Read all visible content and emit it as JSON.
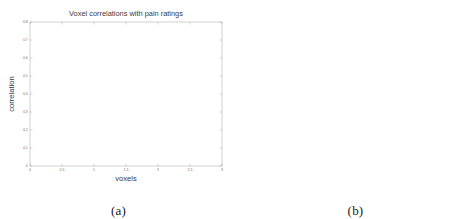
{
  "figure": {
    "panels": [
      {
        "caption": "(a)",
        "chart_data": {
          "type": "area",
          "title": "Voxel correlations with pain ratings",
          "xlabel": "voxels",
          "ylabel": "correlation",
          "x_exponent": "x 10",
          "x_exponent_sup": "4",
          "xlim": [
            0,
            3
          ],
          "ylim": [
            0,
            0.8
          ],
          "xticks": [
            "0",
            "0.5",
            "1",
            "1.5",
            "2",
            "2.5",
            "3"
          ],
          "xtick_values": [
            0,
            0.5,
            1,
            1.5,
            2,
            2.5,
            3
          ],
          "yticks": [
            "0",
            "0.1",
            "0.2",
            "0.3",
            "0.4",
            "0.5",
            "0.6",
            "0.7",
            "0.8"
          ],
          "ytick_values": [
            0,
            0.1,
            0.2,
            0.3,
            0.4,
            0.5,
            0.6,
            0.7,
            0.8
          ],
          "grid": false,
          "legend": "none",
          "series": [
            {
              "name": "mean correlation",
              "x": [
                0.0,
                0.01,
                0.03,
                0.06,
                0.12,
                0.2,
                0.3,
                0.45,
                0.6,
                0.8,
                1.0,
                1.2,
                1.4,
                1.6,
                1.8,
                2.0,
                2.2,
                2.4,
                2.55,
                2.62
              ],
              "values": [
                0.72,
                0.6,
                0.52,
                0.47,
                0.43,
                0.4,
                0.375,
                0.345,
                0.32,
                0.292,
                0.268,
                0.246,
                0.224,
                0.202,
                0.178,
                0.152,
                0.122,
                0.086,
                0.045,
                0.01
              ]
            },
            {
              "name": "upper bound",
              "x": [
                0.0,
                0.01,
                0.03,
                0.06,
                0.12,
                0.2,
                0.3,
                0.45,
                0.6,
                0.8,
                1.0,
                1.2,
                1.4,
                1.6,
                1.8,
                2.0,
                2.2,
                2.4,
                2.55,
                2.62
              ],
              "values": [
                0.735,
                0.64,
                0.566,
                0.52,
                0.48,
                0.452,
                0.428,
                0.396,
                0.37,
                0.34,
                0.314,
                0.29,
                0.266,
                0.242,
                0.216,
                0.187,
                0.153,
                0.112,
                0.064,
                0.022
              ]
            },
            {
              "name": "lower bound",
              "x": [
                0.0,
                0.01,
                0.03,
                0.06,
                0.12,
                0.2,
                0.3,
                0.45,
                0.6,
                0.8,
                1.0,
                1.2,
                1.4,
                1.6,
                1.8,
                2.0,
                2.2,
                2.4,
                2.55,
                2.62
              ],
              "values": [
                0.705,
                0.552,
                0.466,
                0.412,
                0.374,
                0.344,
                0.32,
                0.292,
                0.268,
                0.242,
                0.22,
                0.2,
                0.18,
                0.16,
                0.139,
                0.116,
                0.09,
                0.06,
                0.028,
                0.0
              ]
            }
          ]
        }
      },
      {
        "caption": "(b)",
        "chart_data": {
          "type": "line",
          "title": "Correlation of EN−solutions  with pain",
          "xlabel": "voxels",
          "ylabel": "correlation with task",
          "xlim": [
            0,
            1000
          ],
          "ylim": [
            0,
            0.8
          ],
          "xticks": [
            "0",
            "100",
            "200",
            "300",
            "400",
            "500",
            "600",
            "700",
            "800",
            "900",
            "1000"
          ],
          "xtick_values": [
            0,
            100,
            200,
            300,
            400,
            500,
            600,
            700,
            800,
            900,
            1000
          ],
          "yticks": [
            "0",
            "0.1",
            "0.2",
            "0.3",
            "0.4",
            "0.5",
            "0.6",
            "0.7",
            "0.8"
          ],
          "ytick_values": [
            0,
            0.1,
            0.2,
            0.3,
            0.4,
            0.5,
            0.6,
            0.7,
            0.8
          ],
          "grid": false,
          "legend": "upper right",
          "legend_entries": [
            "1st solution",
            "10th solution",
            "20th solution"
          ],
          "series": [
            {
              "name": "1st solution",
              "style": "solid",
              "x": [
                0,
                8,
                14,
                20,
                30,
                50,
                80,
                120,
                160,
                200,
                250,
                300,
                350,
                400,
                450,
                500,
                550,
                600,
                650,
                700,
                750,
                800,
                850,
                880,
                910,
                935,
                955,
                970,
                982,
                992,
                1000
              ],
              "values": [
                0.7,
                0.745,
                0.785,
                0.73,
                0.706,
                0.694,
                0.686,
                0.68,
                0.672,
                0.664,
                0.652,
                0.64,
                0.626,
                0.61,
                0.592,
                0.572,
                0.55,
                0.526,
                0.5,
                0.474,
                0.446,
                0.416,
                0.382,
                0.36,
                0.334,
                0.306,
                0.278,
                0.246,
                0.212,
                0.178,
                0.15
              ]
            },
            {
              "name": "10th solution",
              "style": "dashdot",
              "x": [
                0,
                20,
                50,
                100,
                150,
                200,
                250,
                300,
                350,
                400,
                450,
                500,
                550,
                600,
                650,
                700,
                750,
                800,
                850,
                900,
                930,
                955,
                972,
                985,
                995,
                1000
              ],
              "values": [
                0.31,
                0.306,
                0.302,
                0.296,
                0.291,
                0.286,
                0.281,
                0.277,
                0.272,
                0.267,
                0.262,
                0.258,
                0.253,
                0.248,
                0.244,
                0.24,
                0.236,
                0.232,
                0.228,
                0.222,
                0.218,
                0.212,
                0.206,
                0.198,
                0.175,
                0.142
              ]
            },
            {
              "name": "20th solution",
              "style": "dashdot-light",
              "x": [
                0,
                20,
                50,
                100,
                150,
                200,
                250,
                300,
                350,
                400,
                450,
                500,
                550,
                600,
                650,
                700,
                750,
                800,
                850,
                900,
                950,
                1000
              ],
              "values": [
                0.08,
                0.079,
                0.078,
                0.076,
                0.074,
                0.072,
                0.07,
                0.068,
                0.066,
                0.064,
                0.062,
                0.06,
                0.058,
                0.056,
                0.054,
                0.052,
                0.05,
                0.048,
                0.046,
                0.044,
                0.042,
                0.04
              ]
            }
          ]
        }
      }
    ]
  }
}
